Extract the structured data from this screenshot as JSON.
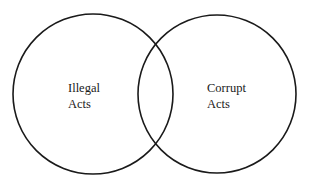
{
  "diagram": {
    "type": "venn",
    "stroke_color": "#1a1a1a",
    "background_color": "#ffffff",
    "sets": [
      {
        "id": "illegal",
        "label_line1": "Illegal",
        "label_line2": "Acts",
        "label": "Illegal Acts",
        "cx": 93,
        "cy": 94,
        "r": 80
      },
      {
        "id": "corrupt",
        "label_line1": "Corrupt",
        "label_line2": "Acts",
        "label": "Corrupt Acts",
        "cx": 217,
        "cy": 94,
        "r": 79
      }
    ],
    "overlap": {
      "between": [
        "Illegal Acts",
        "Corrupt Acts"
      ],
      "label": ""
    }
  }
}
